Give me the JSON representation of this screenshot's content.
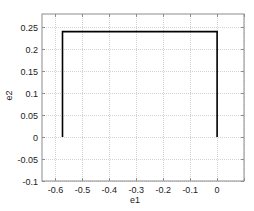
{
  "chart_data": {
    "type": "line",
    "title": "",
    "xlabel": "e1",
    "ylabel": "e2",
    "xlim": [
      -0.65,
      0.1
    ],
    "ylim": [
      -0.1,
      0.28
    ],
    "grid": true,
    "legend": null,
    "x_ticks": [
      -0.6,
      -0.5,
      -0.4,
      -0.3,
      -0.2,
      -0.1,
      0
    ],
    "x_tick_labels": [
      "-0.6",
      "-0.5",
      "-0.4",
      "-0.3",
      "-0.2",
      "-0.1",
      "0"
    ],
    "y_ticks": [
      -0.1,
      -0.05,
      0,
      0.05,
      0.1,
      0.15,
      0.2,
      0.25
    ],
    "y_tick_labels": [
      "-0.1",
      "-0.05",
      "0",
      "0.05",
      "0.1",
      "0.15",
      "0.2",
      "0.25"
    ],
    "series": [
      {
        "name": "path",
        "color": "#000000",
        "x": [
          -0.574,
          -0.574,
          0,
          0
        ],
        "y": [
          0,
          0.24,
          0.24,
          0
        ]
      }
    ]
  },
  "colors": {
    "axis": "#8c8c8c",
    "grid": "#c8c8c8",
    "line": "#000000"
  }
}
